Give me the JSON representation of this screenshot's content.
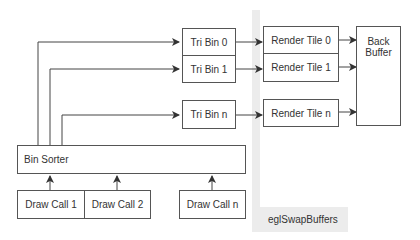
{
  "diagram": {
    "tri_bins": [
      {
        "label": "Tri Bin 0"
      },
      {
        "label": "Tri Bin 1"
      },
      {
        "label": "Tri Bin n"
      }
    ],
    "render_tiles": [
      {
        "label": "Render Tile 0"
      },
      {
        "label": "Render Tile 1"
      },
      {
        "label": "Render Tile n"
      }
    ],
    "back_buffer": {
      "line1": "Back",
      "line2": "Buffer"
    },
    "bin_sorter": {
      "label": "Bin Sorter"
    },
    "draw_calls": [
      {
        "label": "Draw Call 1"
      },
      {
        "label": "Draw Call 2"
      },
      {
        "label": "Draw Call n"
      }
    ],
    "swap_label": "eglSwapBuffers",
    "colors": {
      "stroke": "#555555",
      "band": "#ececec",
      "text": "#333333"
    }
  }
}
